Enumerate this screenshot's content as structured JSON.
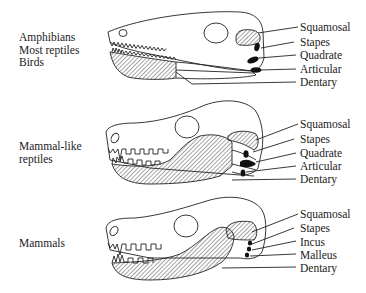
{
  "diagram": {
    "panels": [
      {
        "group_lines": [
          "Amphibians",
          "Most reptiles",
          "Birds"
        ],
        "labels": [
          "Squamosal",
          "Stapes",
          "Quadrate",
          "Articular",
          "Dentary"
        ]
      },
      {
        "group_lines": [
          "Mammal-like",
          "reptiles"
        ],
        "labels": [
          "Squamosal",
          "Stapes",
          "Quadrate",
          "Articular",
          "Dentary"
        ]
      },
      {
        "group_lines": [
          "Mammals"
        ],
        "labels": [
          "Squamosal",
          "Stapes",
          "Incus",
          "Malleus",
          "Dentary"
        ]
      }
    ],
    "legend": {
      "hatched": "Squamosal and Dentary bones",
      "black": "Small jaw/ear bones"
    },
    "colors": {
      "stroke": "#222222",
      "fill_black": "#111111",
      "background": "#ffffff"
    }
  }
}
